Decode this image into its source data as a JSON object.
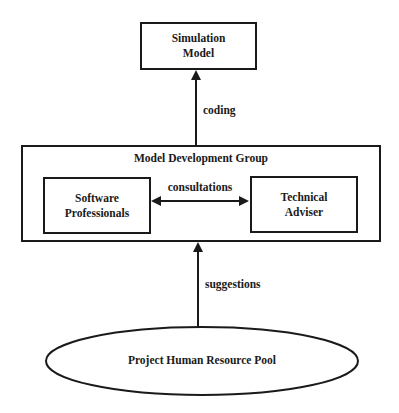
{
  "diagram": {
    "nodes": {
      "simulation_model": {
        "line1": "Simulation",
        "line2": "Model"
      },
      "model_development_group": {
        "title": "Model Development Group"
      },
      "software_professionals": {
        "line1": "Software",
        "line2": "Professionals"
      },
      "technical_adviser": {
        "line1": "Technical",
        "line2": "Adviser"
      },
      "project_human_resource_pool": {
        "label": "Project Human Resource Pool"
      }
    },
    "edges": [
      {
        "from": "model_development_group",
        "to": "simulation_model",
        "label": "coding",
        "direction": "one-way"
      },
      {
        "from": "software_professionals",
        "to": "technical_adviser",
        "label": "consultations",
        "direction": "two-way"
      },
      {
        "from": "project_human_resource_pool",
        "to": "model_development_group",
        "label": "suggestions",
        "direction": "one-way"
      }
    ],
    "colors": {
      "stroke": "#1a1a1a",
      "background": "#ffffff"
    }
  }
}
